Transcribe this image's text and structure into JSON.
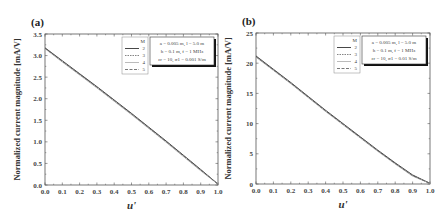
{
  "chart_data": [
    {
      "type": "line",
      "panel_label": "(a)",
      "title": "",
      "xlabel": "u'",
      "ylabel": "Normalized current magnitude [mA/V]",
      "xlim": [
        0.0,
        1.0
      ],
      "ylim": [
        0.0,
        3.5
      ],
      "x_ticks": [
        "0.0",
        "0.1",
        "0.2",
        "0.3",
        "0.4",
        "0.5",
        "0.6",
        "0.7",
        "0.8",
        "0.9",
        "1.0"
      ],
      "y_ticks": [
        "0.0",
        "0.5",
        "1.0",
        "1.5",
        "2.0",
        "2.5",
        "3.0",
        "3.5"
      ],
      "grid": false,
      "legend_title": "M",
      "legend_position": "upper right",
      "params": [
        "a = 0.005 m, l = 5.0 m",
        "h = 0.1 m, f = 1 MHz",
        "εr = 10, σ1 = 0.001 S/m"
      ],
      "x": [
        0.0,
        0.1,
        0.2,
        0.3,
        0.4,
        0.5,
        0.6,
        0.7,
        0.8,
        0.9,
        1.0
      ],
      "series": [
        {
          "name": "2",
          "style": "solid",
          "values": [
            3.18,
            2.88,
            2.58,
            2.28,
            1.97,
            1.66,
            1.34,
            1.02,
            0.69,
            0.36,
            0.02
          ]
        },
        {
          "name": "3",
          "style": "dotted",
          "values": [
            3.17,
            2.86,
            2.56,
            2.26,
            1.95,
            1.64,
            1.32,
            1.0,
            0.67,
            0.34,
            0.02
          ]
        },
        {
          "name": "4",
          "style": "light",
          "values": [
            3.16,
            2.85,
            2.55,
            2.25,
            1.94,
            1.63,
            1.31,
            0.99,
            0.66,
            0.33,
            0.02
          ]
        },
        {
          "name": "5",
          "style": "dashed",
          "values": [
            3.17,
            2.87,
            2.57,
            2.27,
            1.96,
            1.65,
            1.33,
            1.01,
            0.68,
            0.35,
            0.02
          ]
        }
      ]
    },
    {
      "type": "line",
      "panel_label": "(b)",
      "title": "",
      "xlabel": "u'",
      "ylabel": "Normalized current magnitude [mA/V]",
      "xlim": [
        0.0,
        1.0
      ],
      "ylim": [
        0,
        25
      ],
      "x_ticks": [
        "0.0",
        "0.1",
        "0.2",
        "0.3",
        "0.4",
        "0.5",
        "0.6",
        "0.7",
        "0.8",
        "0.9",
        "1.0"
      ],
      "y_ticks": [
        "0",
        "5",
        "10",
        "15",
        "20",
        "25"
      ],
      "grid": false,
      "legend_title": "M",
      "legend_position": "upper right",
      "params": [
        "a = 0.005 m, l = 5.0 m",
        "h = 0.1 m, f = 1 MHz",
        "εr = 10, σ1 = 0.01 S/m"
      ],
      "x": [
        0.0,
        0.1,
        0.2,
        0.3,
        0.4,
        0.5,
        0.6,
        0.7,
        0.8,
        0.9,
        1.0
      ],
      "series": [
        {
          "name": "2",
          "style": "solid",
          "values": [
            21.2,
            19.0,
            16.8,
            14.5,
            12.2,
            10.0,
            7.8,
            5.6,
            3.5,
            1.5,
            0.1
          ]
        },
        {
          "name": "3",
          "style": "dotted",
          "values": [
            21.1,
            18.9,
            16.7,
            14.4,
            12.1,
            9.9,
            7.7,
            5.5,
            3.4,
            1.4,
            0.1
          ]
        },
        {
          "name": "4",
          "style": "light",
          "values": [
            21.0,
            18.8,
            16.6,
            14.3,
            12.0,
            9.8,
            7.6,
            5.4,
            3.3,
            1.3,
            0.1
          ]
        },
        {
          "name": "5",
          "style": "dashed",
          "values": [
            21.1,
            18.9,
            16.7,
            14.4,
            12.1,
            9.9,
            7.7,
            5.5,
            3.4,
            1.4,
            0.1
          ]
        }
      ]
    }
  ]
}
